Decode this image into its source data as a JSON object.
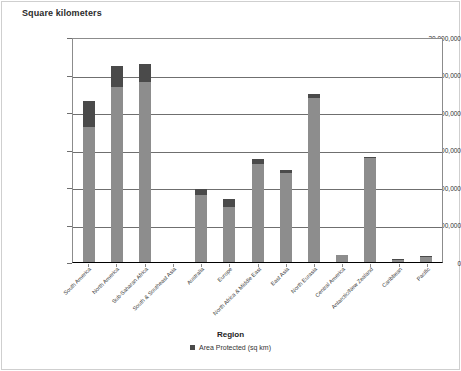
{
  "chart_data": {
    "type": "bar",
    "title": "Square kilometers",
    "xlabel": "Region",
    "ylabel": "Square kilometers",
    "ylim": [
      0,
      30000000
    ],
    "ytick_labels": [
      "30,000,000",
      "25,000,000",
      "20,000,000",
      "15,000,000",
      "10,000,000",
      "5,000,000",
      "0"
    ],
    "ytick_values": [
      30000000,
      25000000,
      20000000,
      15000000,
      10000000,
      5000000,
      0
    ],
    "grid": true,
    "legend_position": "bottom",
    "stacked": true,
    "categories": [
      "South America",
      "North America",
      "Sub-Saharan Africa",
      "South & Southeast Asia",
      "Australia",
      "Europe",
      "North Africa & Middle East",
      "East Asia",
      "North Eurasia",
      "Central America",
      "Antarctic/New Zealand",
      "Caribbean",
      "Pacific"
    ],
    "series": [
      {
        "name": "Total Area (sq km)",
        "color": "#8d8d8d",
        "values": [
          18000000,
          23400000,
          24000000,
          0,
          8900000,
          7300000,
          13100000,
          11900000,
          21900000,
          900000,
          13900000,
          280000,
          700000
        ]
      },
      {
        "name": "Area Protected (sq km)",
        "color": "#4a4a4a",
        "values": [
          3500000,
          2800000,
          2400000,
          0,
          800000,
          1100000,
          600000,
          400000,
          500000,
          100000,
          100000,
          70000,
          100000
        ]
      }
    ],
    "totals": [
      21500000,
      26200000,
      26400000,
      0,
      9700000,
      8400000,
      13700000,
      12300000,
      22400000,
      1000000,
      14000000,
      350000,
      800000
    ],
    "legend_label": "Area Protected (sq km)",
    "legend_swatch_color": "#4a4a4a"
  },
  "bars": [
    {
      "label": "South America",
      "light": 18000000,
      "dark": 3500000
    },
    {
      "label": "North America",
      "light": 23400000,
      "dark": 2800000
    },
    {
      "label": "Sub-Saharan Africa",
      "light": 24000000,
      "dark": 2400000
    },
    {
      "label": "South & Southeast Asia",
      "light": 0,
      "dark": 0
    },
    {
      "label": "Australia",
      "light": 8900000,
      "dark": 800000
    },
    {
      "label": "Europe",
      "light": 7300000,
      "dark": 1100000
    },
    {
      "label": "North Africa & Middle East",
      "light": 13100000,
      "dark": 600000
    },
    {
      "label": "East Asia",
      "light": 11900000,
      "dark": 400000
    },
    {
      "label": "North Eurasia",
      "light": 21900000,
      "dark": 500000
    },
    {
      "label": "Central America",
      "light": 900000,
      "dark": 100000
    },
    {
      "label": "Antarctic/New Zealand",
      "light": 13900000,
      "dark": 100000
    },
    {
      "label": "Caribbean",
      "light": 280000,
      "dark": 70000
    },
    {
      "label": "Pacific",
      "light": 700000,
      "dark": 100000
    }
  ]
}
